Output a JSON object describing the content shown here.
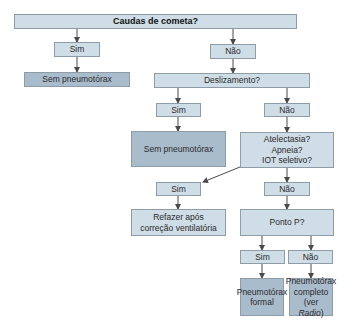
{
  "diagram": {
    "type": "flowchart",
    "colors": {
      "light_box": "#cfdde6",
      "dark_box": "#a9bccb",
      "border": "#8e9ca7",
      "arrow": "#4a4a4a"
    },
    "nodes": {
      "root": "Caudas de cometa?",
      "root_sim": "Sim",
      "root_nao": "Não",
      "sem_pneumo_1": "Sem pneumotórax",
      "deslizamento": "Deslizamento?",
      "desl_sim": "Sim",
      "desl_nao": "Não",
      "sem_pneumo_2": "Sem pneumotórax",
      "atelectasia": [
        "Atelectasia?",
        "Apneia?",
        "IOT seletivo?"
      ],
      "atel_sim": "Sim",
      "atel_nao": "Não",
      "refazer": [
        "Refazer após",
        "correção ventilatória"
      ],
      "ponto_p": "Ponto P?",
      "ponto_sim": "Sim",
      "ponto_nao": "Não",
      "pneumo_formal": [
        "Pneumotórax",
        "formal"
      ],
      "pneumo_completo": {
        "line1": "Pneumotórax",
        "line2": "completo",
        "line3_prefix": "(ver ",
        "line3_italic": "Radio",
        "line3_suffix": ")"
      }
    }
  }
}
